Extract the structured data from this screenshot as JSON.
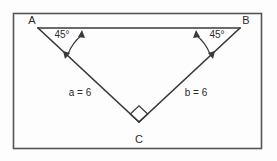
{
  "figure": {
    "background_color": "#fdfdfd",
    "frame": {
      "name": "diagram-border",
      "stroke_color": "#555555",
      "x": 13,
      "y": 13,
      "width": 249,
      "height": 136
    },
    "stroke_color": "#3a3a3a",
    "text_color": "#2b2b2b",
    "vertices": [
      {
        "id": "A",
        "label": "A",
        "x": 38,
        "y": 28,
        "label_x": 32,
        "label_y": 24
      },
      {
        "id": "B",
        "label": "B",
        "x": 240,
        "y": 28,
        "label_x": 245,
        "label_y": 24
      },
      {
        "id": "C",
        "label": "C",
        "x": 139,
        "y": 122,
        "label_x": 139,
        "label_y": 142
      }
    ],
    "angles": [
      {
        "at": "A",
        "label": "45°",
        "label_x": 62,
        "label_y": 37,
        "value": 45
      },
      {
        "at": "B",
        "label": "45°",
        "label_x": 216,
        "label_y": 37,
        "value": 45
      }
    ],
    "right_angle": {
      "at": "C",
      "marker": "square",
      "value": 90
    },
    "sides": [
      {
        "id": "a",
        "label": "a = 6",
        "from": "A",
        "to": "C",
        "length": 6,
        "label_x": 80,
        "label_y": 93
      },
      {
        "id": "b",
        "label": "b = 6",
        "from": "C",
        "to": "B",
        "length": 6,
        "label_x": 196,
        "label_y": 93
      },
      {
        "id": "c",
        "label": "",
        "from": "A",
        "to": "B",
        "length": null,
        "label_x": 0,
        "label_y": 0
      }
    ]
  }
}
